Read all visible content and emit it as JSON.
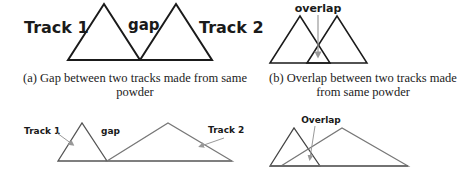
{
  "panel_a": {
    "label_track1": "Track 1",
    "label_gap": "gap",
    "label_track2": "Track 2",
    "caption_line1": "(a) Gap between two tracks made from same",
    "caption_line2": "powder"
  },
  "panel_b": {
    "label_overlap": "overlap",
    "caption_line1": "(b) Overlap between two tracks made",
    "caption_line2": "from same powder"
  },
  "panel_c": {
    "label_track1": "Track 1",
    "label_gap": "gap",
    "label_track2": "Track 2"
  },
  "panel_d": {
    "label_overlap": "Overlap"
  },
  "colors": {
    "line_dark": "#1a1a1a",
    "line_gray": "#777777",
    "arrow_gray": "#999999"
  }
}
